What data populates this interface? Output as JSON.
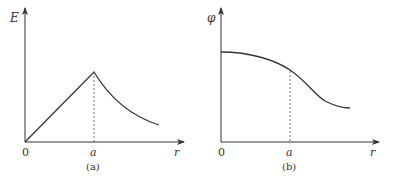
{
  "figure": {
    "panels": [
      {
        "id": "a",
        "caption": "(a)",
        "y_label": "E",
        "x_label": "r",
        "origin_label": "0",
        "tick_label": "a",
        "description": "E rises linearly from 0 to a peak at r=a, then decays for r>a"
      },
      {
        "id": "b",
        "caption": "(b)",
        "y_label": "φ",
        "x_label": "r",
        "origin_label": "0",
        "tick_label": "a",
        "description": "φ is flat near r=0 and decreases smoothly, with an inflection beyond r=a"
      }
    ],
    "colors": {
      "line": "#333333",
      "background": "#ffffff"
    }
  }
}
